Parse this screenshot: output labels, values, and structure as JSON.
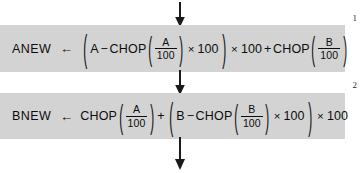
{
  "diagram": {
    "type": "flowchart-statements",
    "background_color": "#ffffff",
    "band_color": "#d3d3d3",
    "text_color": "#0d0d0d",
    "arrows": {
      "top": {
        "name": "flow-arrow-top",
        "direction": "down"
      },
      "middle": {
        "name": "flow-arrow-middle",
        "direction": "down"
      },
      "bottom": {
        "name": "flow-arrow-bottom",
        "direction": "down"
      }
    },
    "steps": [
      {
        "number": "1",
        "target": "ANEW",
        "assign": "←",
        "expression_text": "(A − CHOP(A/100) × 100) × 100 + CHOP(B/100)",
        "tokens": {
          "open_outer": "(",
          "a": "A",
          "minus": "−",
          "chop1": "CHOP",
          "open1": "(",
          "frac1_num": "A",
          "frac1_den": "100",
          "close1": ")",
          "times1": "×",
          "hundred1": "100",
          "close_outer": ")",
          "times2": "×",
          "hundred2": "100",
          "plus": "+",
          "chop2": "CHOP",
          "open2": "(",
          "frac2_num": "B",
          "frac2_den": "100",
          "close2": ")"
        }
      },
      {
        "number": "2",
        "target": "BNEW",
        "assign": "←",
        "expression_text": "CHOP(A/100) + (B − CHOP(B/100) × 100) × 100",
        "tokens": {
          "chop1": "CHOP",
          "open1": "(",
          "frac1_num": "A",
          "frac1_den": "100",
          "close1": ")",
          "plus": "+",
          "open_outer": "(",
          "b": "B",
          "minus": "−",
          "chop2": "CHOP",
          "open2": "(",
          "frac2_num": "B",
          "frac2_den": "100",
          "close2": ")",
          "times1": "×",
          "hundred1": "100",
          "close_outer": ")",
          "times2": "×",
          "hundred2": "100"
        }
      }
    ]
  }
}
